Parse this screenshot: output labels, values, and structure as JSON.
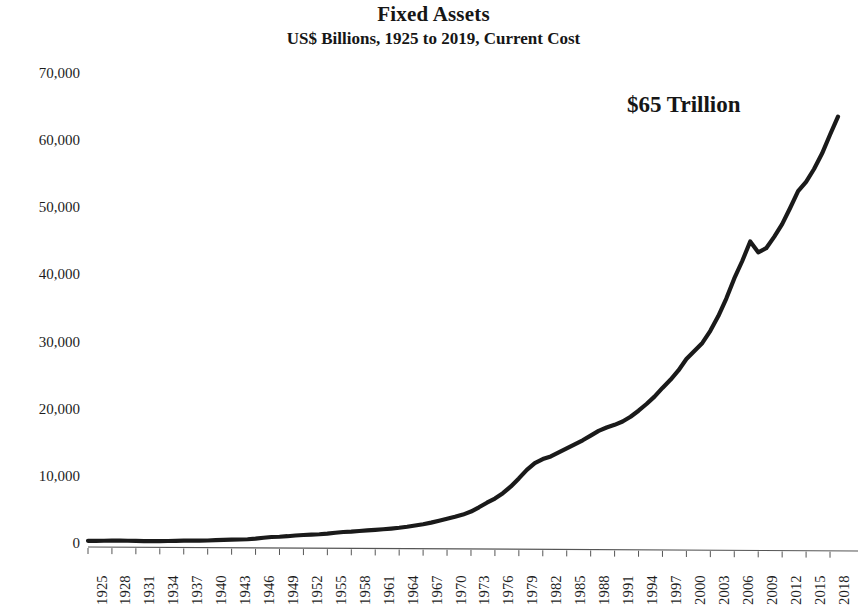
{
  "chart_data": {
    "type": "line",
    "title": "Fixed Assets",
    "subtitle": "US$ Billions, 1925 to 2019, Current Cost",
    "xlabel": "",
    "ylabel": "",
    "xlim": [
      1925,
      2019
    ],
    "ylim": [
      0,
      70000
    ],
    "grid": false,
    "legend": null,
    "line_color": "#1a1a1a",
    "annotations": [
      {
        "text": "$65 Trillion",
        "x": 2008,
        "y": 66000
      }
    ],
    "ytick_labels": [
      "70,000",
      "60,000",
      "50,000",
      "40,000",
      "30,000",
      "20,000",
      "10,000",
      "0"
    ],
    "ytick_values": [
      70000,
      60000,
      50000,
      40000,
      30000,
      20000,
      10000,
      0
    ],
    "xtick_labels": [
      "1925",
      "1928",
      "1931",
      "1934",
      "1937",
      "1940",
      "1943",
      "1946",
      "1949",
      "1952",
      "1955",
      "1958",
      "1961",
      "1964",
      "1967",
      "1970",
      "1973",
      "1976",
      "1979",
      "1982",
      "1985",
      "1988",
      "1991",
      "1994",
      "1997",
      "2000",
      "2003",
      "2006",
      "2009",
      "2012",
      "2015",
      "2018"
    ],
    "xtick_values": [
      1925,
      1928,
      1931,
      1934,
      1937,
      1940,
      1943,
      1946,
      1949,
      1952,
      1955,
      1958,
      1961,
      1964,
      1967,
      1970,
      1973,
      1976,
      1979,
      1982,
      1985,
      1988,
      1991,
      1994,
      1997,
      2000,
      2003,
      2006,
      2009,
      2012,
      2015,
      2018
    ],
    "x": [
      1925,
      1926,
      1927,
      1928,
      1929,
      1930,
      1931,
      1932,
      1933,
      1934,
      1935,
      1936,
      1937,
      1938,
      1939,
      1940,
      1941,
      1942,
      1943,
      1944,
      1945,
      1946,
      1947,
      1948,
      1949,
      1950,
      1951,
      1952,
      1953,
      1954,
      1955,
      1956,
      1957,
      1958,
      1959,
      1960,
      1961,
      1962,
      1963,
      1964,
      1965,
      1966,
      1967,
      1968,
      1969,
      1970,
      1971,
      1972,
      1973,
      1974,
      1975,
      1976,
      1977,
      1978,
      1979,
      1980,
      1981,
      1982,
      1983,
      1984,
      1985,
      1986,
      1987,
      1988,
      1989,
      1990,
      1991,
      1992,
      1993,
      1994,
      1995,
      1996,
      1997,
      1998,
      1999,
      2000,
      2001,
      2002,
      2003,
      2004,
      2005,
      2006,
      2007,
      2008,
      2009,
      2010,
      2011,
      2012,
      2013,
      2014,
      2015,
      2016,
      2017,
      2018,
      2019
    ],
    "values": [
      320,
      330,
      335,
      340,
      345,
      335,
      310,
      285,
      275,
      285,
      295,
      315,
      340,
      340,
      350,
      375,
      420,
      470,
      500,
      520,
      560,
      650,
      780,
      890,
      930,
      1010,
      1120,
      1190,
      1250,
      1300,
      1400,
      1530,
      1640,
      1700,
      1790,
      1880,
      1960,
      2050,
      2150,
      2270,
      2420,
      2610,
      2800,
      3030,
      3320,
      3610,
      3900,
      4230,
      4680,
      5320,
      6000,
      6620,
      7420,
      8420,
      9620,
      10900,
      11900,
      12500,
      12900,
      13500,
      14100,
      14700,
      15300,
      16000,
      16700,
      17200,
      17600,
      18100,
      18800,
      19700,
      20700,
      21800,
      23100,
      24300,
      25700,
      27400,
      28600,
      29800,
      31600,
      33800,
      36400,
      39400,
      42000,
      44900,
      43300,
      43900,
      45600,
      47500,
      49900,
      52400,
      53800,
      55700,
      58000,
      60800,
      63500
    ],
    "value_units": "US$ Billions"
  }
}
